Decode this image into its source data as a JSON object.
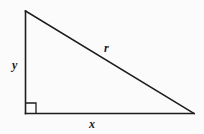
{
  "figure": {
    "type": "geometry-diagram",
    "shape_name": "right-triangle",
    "background_color": "#fbfbfb",
    "stroke_color": "#1d1d1d",
    "width": 204,
    "height": 134,
    "vertices": {
      "apex_top_left": {
        "x": 25.5,
        "y": 11
      },
      "right_angle_bottom_left": {
        "x": 25.5,
        "y": 113.5
      },
      "bottom_right": {
        "x": 194,
        "y": 113.5
      }
    },
    "sides": [
      {
        "name": "vertical-leg",
        "label": "y",
        "from": "apex_top_left",
        "to": "right_angle_bottom_left",
        "label_position": {
          "x": 15,
          "y": 69
        }
      },
      {
        "name": "hypotenuse",
        "label": "r",
        "from": "apex_top_left",
        "to": "bottom_right",
        "label_position": {
          "x": 104,
          "y": 52
        }
      },
      {
        "name": "horizontal-leg",
        "label": "x",
        "from": "right_angle_bottom_left",
        "to": "bottom_right",
        "label_position": {
          "x": 89,
          "y": 128
        }
      }
    ],
    "right_angle_marker": {
      "name": "right-angle-square",
      "corner": "right_angle_bottom_left",
      "size": 10,
      "x": 26,
      "y": 103
    }
  }
}
